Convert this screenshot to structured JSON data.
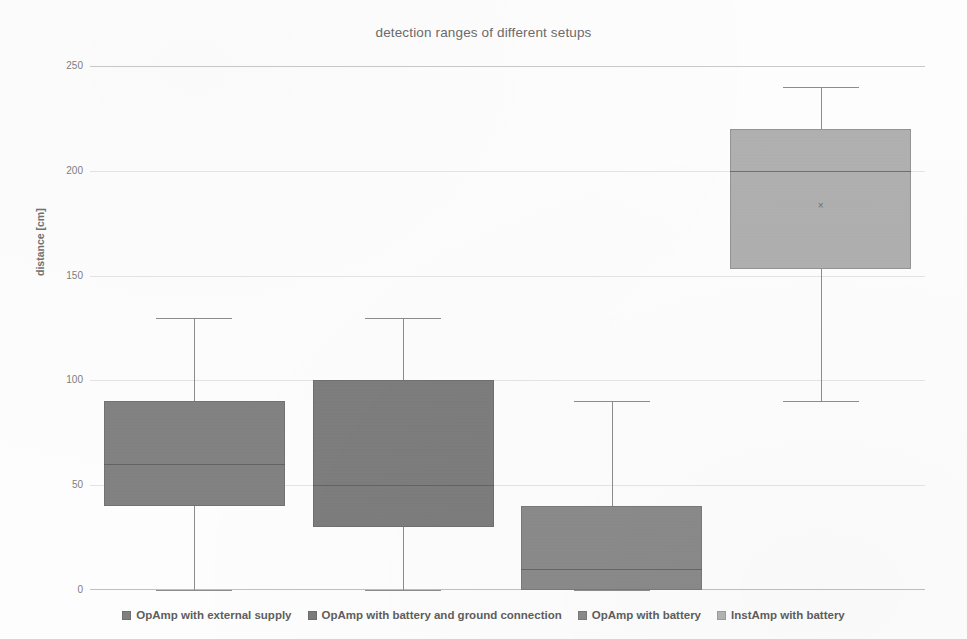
{
  "chart_data": {
    "type": "box",
    "title": "detection ranges of different setups",
    "xlabel": "",
    "ylabel": "distance [cm]",
    "ylim": [
      0,
      250
    ],
    "yticks": [
      0,
      50,
      100,
      150,
      200,
      250
    ],
    "ytick_labels": [
      "0",
      "50",
      "100",
      "150",
      "200",
      "250"
    ],
    "grid": true,
    "legend_position": "bottom",
    "series": [
      {
        "name": "OpAmp with external supply",
        "color": "#808080",
        "whisker_low": 0,
        "q1": 40,
        "median": 60,
        "q3": 90,
        "whisker_high": 130,
        "mean": null
      },
      {
        "name": "OpAmp with battery and ground connection",
        "color": "#7b7b7b",
        "whisker_low": 0,
        "q1": 30,
        "median": 50,
        "q3": 100,
        "whisker_high": 130,
        "mean": null
      },
      {
        "name": "OpAmp with battery",
        "color": "#8a8a8a",
        "whisker_low": 0,
        "q1": 0,
        "median": 10,
        "q3": 40,
        "whisker_high": 90,
        "mean": null
      },
      {
        "name": "InstAmp with battery",
        "color": "#b3b3b3",
        "whisker_low": 90,
        "q1": 153,
        "median": 200,
        "q3": 220,
        "whisker_high": 240,
        "mean": 183
      }
    ]
  },
  "legend": {
    "items": [
      {
        "label": "OpAmp with external supply",
        "swatch": "#808080"
      },
      {
        "label": "OpAmp with battery and ground connection",
        "swatch": "#7b7b7b"
      },
      {
        "label": "OpAmp with battery",
        "swatch": "#8a8a8a"
      },
      {
        "label": "InstAmp with battery",
        "swatch": "#b3b3b3"
      }
    ]
  },
  "mean_marker_glyph": "×"
}
